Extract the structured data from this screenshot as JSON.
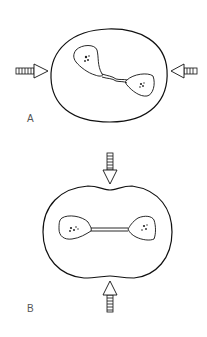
{
  "figure": {
    "panels": [
      {
        "id": "A",
        "label": "A",
        "description": "Oval cell with irregular dumbbell-shaped nuclei joined by a wavy bridge; compressed from left and right"
      },
      {
        "id": "B",
        "label": "B",
        "description": "Cell indented top and bottom with symmetric nuclei connected by a straight bridge; compressed from top and bottom"
      }
    ],
    "arrows": {
      "A": [
        "right-pointing",
        "left-pointing"
      ],
      "B": [
        "down-pointing",
        "up-pointing"
      ]
    },
    "colors": {
      "stroke": "#111111",
      "background": "#ffffff",
      "label": "#555555"
    }
  }
}
